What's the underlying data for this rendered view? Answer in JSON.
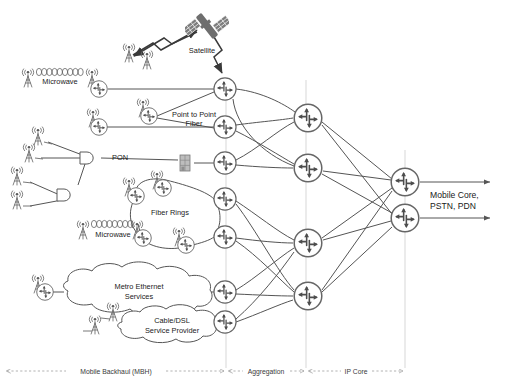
{
  "diagram": {
    "colors": {
      "line": "#555555",
      "router_stroke": "#666666",
      "arrow_glyph": "#4d4d4d",
      "satellite_fill": "#6e6e6e",
      "building_fill": "#b5b5b5",
      "text": "#1a1a1a",
      "zone_divider": "#bbbbbb"
    },
    "labels": {
      "satellite": "Satellite",
      "microwave_top": "Microwave",
      "microwave_mid": "Microwave",
      "point_to_point_fiber_line1": "Point to Point",
      "point_to_point_fiber_line2": "Fiber",
      "pon": "PON",
      "fiber_rings": "Fiber Rings",
      "metro_ethernet_line1": "Metro Ethernet",
      "metro_ethernet_line2": "Services",
      "cable_dsl_line1": "Cable/DSL",
      "cable_dsl_line2": "Service Provider",
      "mobile_core_line1": "Mobile Core,",
      "mobile_core_line2": "PSTN, PDN"
    },
    "zones": [
      {
        "name": "mobile-backhaul",
        "label": "Mobile Backhaul (MBH)",
        "x_start": 6,
        "x_end": 225,
        "text_x": 116
      },
      {
        "name": "aggregation",
        "label": "Aggregation",
        "x_start": 228,
        "x_end": 305,
        "text_x": 266
      },
      {
        "name": "ip-core",
        "label": "IP Core",
        "x_start": 308,
        "x_end": 404,
        "text_x": 356
      }
    ],
    "zone_label_y": 373,
    "zone_dividers": [
      {
        "name": "divider-mbh-aggregation",
        "x": 226,
        "y_top": 80,
        "y_bottom": 368
      },
      {
        "name": "divider-aggregation-ipcore",
        "x": 306,
        "y_top": 80,
        "y_bottom": 368
      },
      {
        "name": "divider-ipcore-right",
        "x": 405,
        "y_top": 150,
        "y_bottom": 368
      }
    ],
    "routers": {
      "edge": [
        {
          "name": "router-edge-satellite",
          "x": 225,
          "y": 89,
          "r": 11
        },
        {
          "name": "router-edge-p2p-fiber",
          "x": 225,
          "y": 127,
          "r": 11
        },
        {
          "name": "router-edge-pon",
          "x": 225,
          "y": 163,
          "r": 11
        },
        {
          "name": "router-edge-fiber-ring-top",
          "x": 225,
          "y": 199,
          "r": 11
        },
        {
          "name": "router-edge-fiber-ring-bottom",
          "x": 225,
          "y": 237,
          "r": 11
        },
        {
          "name": "router-edge-metro-ethernet",
          "x": 225,
          "y": 292,
          "r": 11
        },
        {
          "name": "router-edge-cable-dsl",
          "x": 225,
          "y": 322,
          "r": 11
        }
      ],
      "aggregation": [
        {
          "name": "router-aggregation-1",
          "x": 308,
          "y": 118,
          "r": 15
        },
        {
          "name": "router-aggregation-2",
          "x": 308,
          "y": 168,
          "r": 15
        },
        {
          "name": "router-aggregation-3",
          "x": 308,
          "y": 243,
          "r": 15
        },
        {
          "name": "router-aggregation-4",
          "x": 308,
          "y": 296,
          "r": 15
        }
      ],
      "core": [
        {
          "name": "router-core-1",
          "x": 405,
          "y": 182,
          "r": 15
        },
        {
          "name": "router-core-2",
          "x": 405,
          "y": 218,
          "r": 15
        }
      ],
      "access": [
        {
          "name": "router-access-microwave-top",
          "x": 99,
          "y": 89,
          "r": 8
        },
        {
          "name": "router-access-p2p-a",
          "x": 99,
          "y": 127,
          "r": 8
        },
        {
          "name": "router-access-p2p-b",
          "x": 149,
          "y": 116,
          "r": 8
        },
        {
          "name": "router-access-ring-upper-left",
          "x": 136,
          "y": 196,
          "r": 8
        },
        {
          "name": "router-access-ring-upper-right",
          "x": 163,
          "y": 188,
          "r": 8
        },
        {
          "name": "router-access-ring-lower-left",
          "x": 143,
          "y": 238,
          "r": 8
        },
        {
          "name": "router-access-ring-lower-right",
          "x": 186,
          "y": 245,
          "r": 8
        },
        {
          "name": "router-access-metro-ethernet",
          "x": 45,
          "y": 292,
          "r": 8
        }
      ]
    },
    "towers": [
      {
        "name": "tower-microwave-left",
        "x": 27,
        "y": 80
      },
      {
        "name": "tower-microwave-right",
        "x": 92,
        "y": 80
      },
      {
        "name": "tower-satellite-a",
        "x": 128,
        "y": 48
      },
      {
        "name": "tower-satellite-b",
        "x": 146,
        "y": 55
      },
      {
        "name": "tower-p2p-a",
        "x": 92,
        "y": 118
      },
      {
        "name": "tower-p2p-b",
        "x": 121,
        "y": 107
      },
      {
        "name": "tower-ring-1",
        "x": 128,
        "y": 187
      },
      {
        "name": "tower-ring-2",
        "x": 155,
        "y": 180
      },
      {
        "name": "tower-ring-3",
        "x": 136,
        "y": 229
      },
      {
        "name": "tower-ring-4",
        "x": 178,
        "y": 236
      },
      {
        "name": "tower-microwave-mid-left",
        "x": 82,
        "y": 230
      },
      {
        "name": "tower-metro-ethernet",
        "x": 37,
        "y": 283
      },
      {
        "name": "tower-cable-dsl-a",
        "x": 112,
        "y": 311
      },
      {
        "name": "tower-cable-dsl-b",
        "x": 94,
        "y": 324
      },
      {
        "name": "tower-pon-1",
        "x": 37,
        "y": 135
      },
      {
        "name": "tower-pon-2",
        "x": 28,
        "y": 152
      },
      {
        "name": "tower-pon-3",
        "x": 16,
        "y": 175
      },
      {
        "name": "tower-pon-4",
        "x": 16,
        "y": 198
      }
    ],
    "pon_splitters": [
      {
        "name": "pon-splitter-main",
        "x": 85,
        "y": 158
      },
      {
        "name": "pon-splitter-secondary",
        "x": 62,
        "y": 195
      }
    ],
    "microwave_links": [
      {
        "name": "microwave-link-top",
        "x1": 36,
        "y1": 72,
        "x2": 84,
        "y2": 72,
        "beads": 10
      },
      {
        "name": "microwave-link-mid",
        "x1": 91,
        "y1": 224,
        "x2": 131,
        "y2": 224,
        "beads": 9
      }
    ],
    "satellite": {
      "name": "satellite-icon",
      "x": 205,
      "y": 27
    },
    "building": {
      "name": "building-icon",
      "x": 185,
      "y": 163
    },
    "egress_arrows": [
      {
        "name": "egress-arrow-1",
        "x1": 420,
        "y1": 182,
        "x2": 492,
        "y2": 182
      },
      {
        "name": "egress-arrow-2",
        "x1": 420,
        "y1": 218,
        "x2": 492,
        "y2": 218
      }
    ]
  }
}
